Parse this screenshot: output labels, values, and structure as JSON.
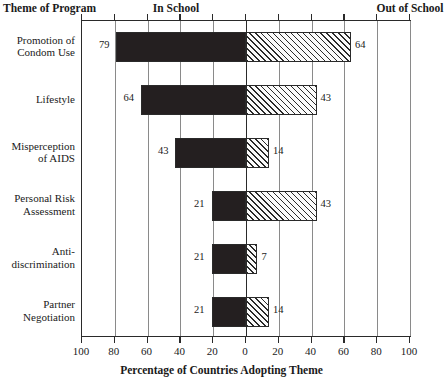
{
  "headers": {
    "theme": "Theme of Program",
    "left_panel": "In School",
    "right_panel": "Out of School"
  },
  "axis": {
    "title": "Percentage of Countries Adopting Theme",
    "tick_labels": [
      "100",
      "80",
      "60",
      "40",
      "20",
      "0",
      "20",
      "40",
      "60",
      "80",
      "100"
    ]
  },
  "chart_data": {
    "type": "bar",
    "orientation": "horizontal",
    "style": "bidirectional-diverging",
    "title": "",
    "xlabel": "Percentage of Countries Adopting Theme",
    "ylabel": "Theme of Program",
    "xlim": [
      -100,
      100
    ],
    "xticks": [
      -100,
      -80,
      -60,
      -40,
      -20,
      0,
      20,
      40,
      60,
      80,
      100
    ],
    "xtick_labels": [
      "100",
      "80",
      "60",
      "40",
      "20",
      "0",
      "20",
      "40",
      "60",
      "80",
      "100"
    ],
    "grid": true,
    "legend": "panel-headers",
    "categories": [
      "Promotion of Condom Use",
      "Lifestyle",
      "Misperception of AIDS",
      "Personal Risk Assessment",
      "Anti-discrimination",
      "Partner Negotiation"
    ],
    "series": [
      {
        "name": "In School",
        "direction": "left",
        "fill": "solid-dark",
        "values": [
          79,
          64,
          43,
          21,
          21,
          21
        ]
      },
      {
        "name": "Out of School",
        "direction": "right",
        "fill": "diagonal-hatch",
        "values": [
          64,
          43,
          14,
          43,
          7,
          14
        ]
      }
    ]
  },
  "rows": [
    {
      "label_line1": "Promotion of",
      "label_line2": "Condom Use",
      "left_value": "79",
      "right_value": "64"
    },
    {
      "label_line1": "Lifestyle",
      "label_line2": "",
      "left_value": "64",
      "right_value": "43"
    },
    {
      "label_line1": "Misperception",
      "label_line2": "of AIDS",
      "left_value": "43",
      "right_value": "14"
    },
    {
      "label_line1": "Personal Risk",
      "label_line2": "Assessment",
      "left_value": "21",
      "right_value": "43"
    },
    {
      "label_line1": "Anti-",
      "label_line2": "discrimination",
      "left_value": "21",
      "right_value": "7"
    },
    {
      "label_line1": "Partner",
      "label_line2": "Negotiation",
      "left_value": "21",
      "right_value": "14"
    }
  ],
  "colors": {
    "bar_left": "#241f20",
    "bar_right_line": "#2a2a2a",
    "axis": "#2a2a2a",
    "grid": "#8a8a8a"
  }
}
